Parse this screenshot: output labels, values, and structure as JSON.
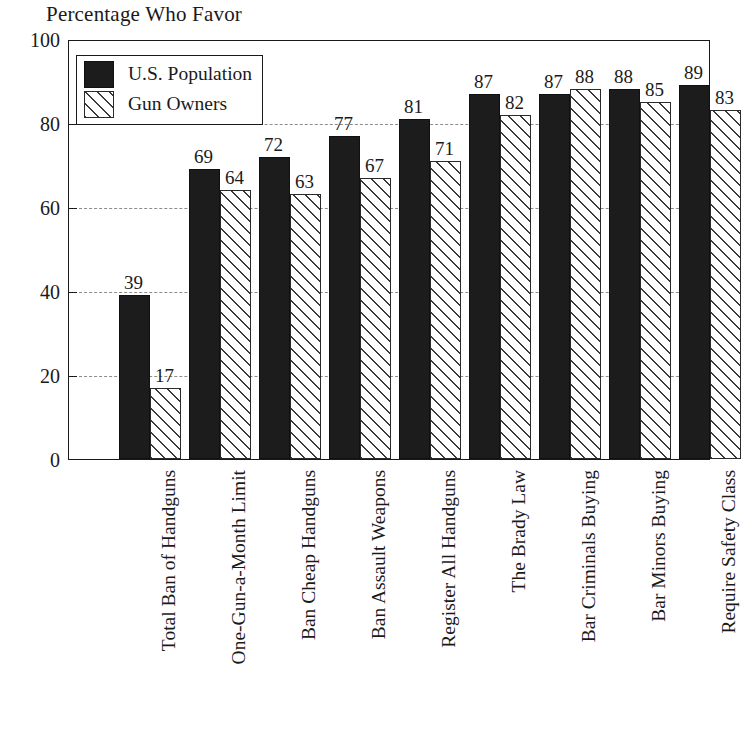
{
  "chart_data": {
    "type": "bar",
    "title": "Percentage Who Favor",
    "xlabel": "",
    "ylabel": "",
    "ylim": [
      0,
      100
    ],
    "yticks": [
      0,
      20,
      40,
      60,
      80,
      100
    ],
    "grid": true,
    "legend_position": "top-left",
    "categories": [
      "Total Ban of Handguns",
      "One-Gun-a-Month Limit",
      "Ban Cheap Handguns",
      "Ban Assault Weapons",
      "Register All Handguns",
      "The Brady Law",
      "Bar Criminals Buying",
      "Bar Minors Buying",
      "Require Safety Class"
    ],
    "series": [
      {
        "name": "U.S. Population",
        "pattern": "solid-black",
        "color": "#1c1c1c",
        "values": [
          39,
          69,
          72,
          77,
          81,
          87,
          87,
          88,
          89
        ]
      },
      {
        "name": "Gun Owners",
        "pattern": "diagonal-hatch",
        "color": "#ffffff",
        "values": [
          17,
          64,
          63,
          67,
          71,
          82,
          88,
          85,
          83
        ]
      }
    ]
  }
}
